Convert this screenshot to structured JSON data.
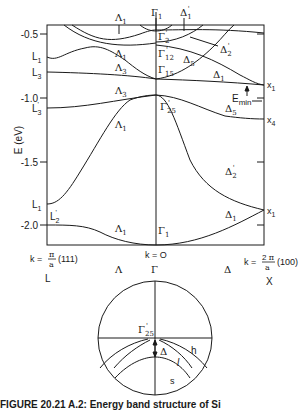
{
  "figure": {
    "type": "band-structure-diagram",
    "y_axis_label": "E (eV)",
    "y_ticks": [
      "-0.5",
      "-1.0",
      "-1.5",
      "-2.0"
    ],
    "x_labels": {
      "left_k": "k = π/a (111)",
      "left_point": "L",
      "center_k": "k = O",
      "center_point": "Γ",
      "right_k": "k = 2π/a (100)",
      "right_point": "X",
      "left_direction": "Λ",
      "right_direction": "Δ"
    },
    "left_edge_labels": [
      "L1",
      "L3",
      "L3'",
      "L1",
      "L2'"
    ],
    "right_edge_labels": [
      "x1",
      "x4",
      "x1"
    ],
    "gamma_labels": [
      "Γ1",
      "Γ2'",
      "Γ12'",
      "Γ15",
      "Γ25'",
      "Γ1"
    ],
    "band_labels_lambda": [
      "Λ1",
      "Λ1",
      "Λ3",
      "Λ3",
      "Λ1",
      "Λ1"
    ],
    "band_labels_delta": [
      "Δ1'",
      "Δ2'",
      "Δ5",
      "Δ1",
      "Δ5",
      "Δ2'",
      "Δ1"
    ],
    "annotation": "Emin",
    "inset": {
      "point_label": "Γ25'",
      "gap_label": "Δ",
      "band_labels": [
        "h",
        "l",
        "s"
      ]
    }
  },
  "caption": "FIGURE 20.21 A.2: Energy band structure of Si"
}
